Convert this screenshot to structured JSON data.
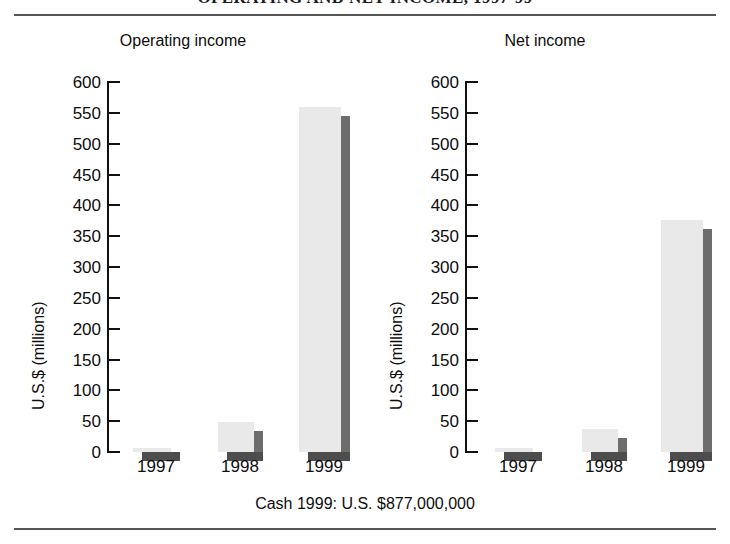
{
  "figure": {
    "title": "OPERATING AND NET INCOME, 1997-99",
    "caption": "Cash 1999: U.S. $877,000,000",
    "bar_fill_color": "#e9e9e9",
    "bar_shadow_color": "#6d6d6d",
    "axis_color": "#111111",
    "rule_color": "#555555"
  },
  "chart_data": [
    {
      "type": "bar",
      "title": "Operating income",
      "xlabel": "",
      "ylabel": "U.S.$ (millions)",
      "categories": [
        "1997",
        "1998",
        "1999"
      ],
      "values": [
        3,
        48,
        560
      ],
      "ylim": [
        0,
        600
      ],
      "yticks": [
        0,
        50,
        100,
        150,
        200,
        250,
        300,
        350,
        400,
        450,
        500,
        550,
        600
      ],
      "ytick_labels": [
        "0",
        "50",
        "100",
        "150",
        "200",
        "250",
        "300",
        "350",
        "400",
        "450",
        "500",
        "550",
        "600"
      ],
      "grid": false,
      "legend": false
    },
    {
      "type": "bar",
      "title": "Net income",
      "xlabel": "",
      "ylabel": "U.S.$ (millions)",
      "categories": [
        "1997",
        "1998",
        "1999"
      ],
      "values": [
        5,
        38,
        376
      ],
      "ylim": [
        0,
        600
      ],
      "yticks": [
        0,
        50,
        100,
        150,
        200,
        250,
        300,
        350,
        400,
        450,
        500,
        550,
        600
      ],
      "ytick_labels": [
        "0",
        "50",
        "100",
        "150",
        "200",
        "250",
        "300",
        "350",
        "400",
        "450",
        "500",
        "550",
        "600"
      ],
      "grid": false,
      "legend": false
    }
  ]
}
